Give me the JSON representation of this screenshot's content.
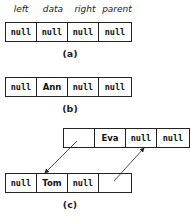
{
  "field_labels": [
    "left",
    "data",
    "right",
    "parent"
  ],
  "diagram_a": {
    "caption": "(a)",
    "cells": [
      "null",
      "null",
      "null",
      "null"
    ]
  },
  "diagram_b": {
    "caption": "(b)",
    "cells": [
      "null",
      "Ann",
      "null",
      "null"
    ]
  },
  "diagram_c": {
    "caption": "(c)",
    "parent_node": {
      "cells": [
        "",
        "Eva",
        "null",
        "null"
      ]
    },
    "child_node": {
      "cells": [
        "null",
        "Tom",
        "null",
        ""
      ]
    },
    "arrows": [
      {
        "from": "Eva.left",
        "to": "Tom node"
      },
      {
        "from": "Tom.parent",
        "to": "Eva node"
      }
    ]
  },
  "colors": {
    "line": "#222222",
    "background": "#ffffff"
  }
}
